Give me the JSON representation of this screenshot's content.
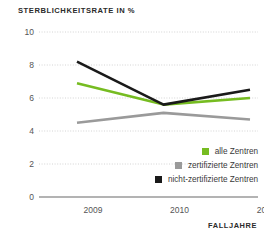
{
  "chart_data": {
    "type": "line",
    "title": "STERBLICHKEITSRATE IN %",
    "xlabel": "FALLJAHRE",
    "ylabel": "",
    "categories": [
      "2009",
      "2010",
      "2011"
    ],
    "x": [
      2009,
      2010,
      2011
    ],
    "ylim": [
      0,
      10
    ],
    "yticks": [
      0,
      2,
      4,
      6,
      8,
      10
    ],
    "ytick_labels": [
      "0",
      "2",
      "4",
      "6",
      "8",
      "10"
    ],
    "xtick_labels": [
      "2009",
      "2010",
      "2011"
    ],
    "grid": true,
    "grid_style": "dotted-horizontal",
    "legend_position": "inside-lower-right",
    "series": [
      {
        "name": "alle Zentren",
        "color": "#76bc21",
        "values": [
          6.9,
          5.6,
          6.0
        ]
      },
      {
        "name": "zertifizierte Zentren",
        "color": "#9a9a9a",
        "values": [
          4.5,
          5.1,
          4.7
        ]
      },
      {
        "name": "nicht-zertifizierte Zentren",
        "color": "#1a1a1a",
        "values": [
          8.2,
          5.6,
          6.5
        ]
      }
    ]
  },
  "colors": {
    "accent_green": "#76bc21",
    "gray_series": "#9a9a9a",
    "black_series": "#1a1a1a",
    "gridline": "#cfcfcf",
    "axis_line": "#9a9a9a",
    "tick_text": "#555555",
    "title_text": "#2b2b2b"
  }
}
